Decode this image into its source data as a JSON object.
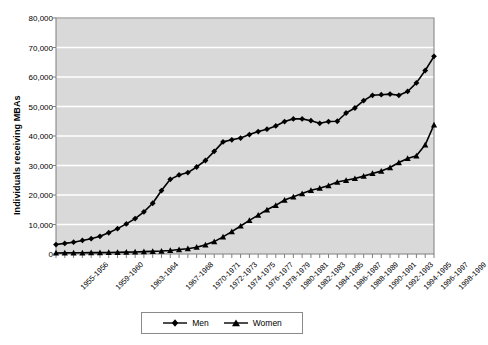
{
  "chart_data": {
    "type": "line",
    "title": "",
    "xlabel": "",
    "ylabel": "Individuals receiving MBAs",
    "ylim": [
      0,
      80000
    ],
    "ytick_labels": [
      "80,000",
      "70,000",
      "60,000",
      "50,000",
      "40,000",
      "30,000",
      "20,000",
      "10,000",
      "0"
    ],
    "ytick_values": [
      80000,
      70000,
      60000,
      50000,
      40000,
      30000,
      20000,
      10000,
      0
    ],
    "grid": true,
    "legend_position": "bottom",
    "categories": [
      "1955-1956",
      "1956-1957",
      "1957-1958",
      "1958-1959",
      "1959-1960",
      "1960-1961",
      "1961-1962",
      "1962-1963",
      "1963-1964",
      "1964-1965",
      "1965-1966",
      "1966-1967",
      "1967-1968",
      "1968-1969",
      "1969-1970",
      "1970-1971",
      "1971-1972",
      "1972-1973",
      "1973-1974",
      "1974-1975",
      "1975-1976",
      "1976-1977",
      "1977-1978",
      "1978-1979",
      "1979-1980",
      "1980-1981",
      "1981-1982",
      "1982-1983",
      "1983-1984",
      "1984-1985",
      "1985-1986",
      "1986-1987",
      "1987-1988",
      "1988-1989",
      "1989-1990",
      "1990-1991",
      "1991-1992",
      "1992-1993",
      "1993-1994",
      "1994-1995",
      "1995-1996",
      "1996-1997",
      "1997-1998",
      "1998-1999"
    ],
    "xtick_labels": [
      "1955-1956",
      "1959-1960",
      "1963-1964",
      "1967-1968",
      "1970-1971",
      "1972-1973",
      "1974-1975",
      "1976-1977",
      "1978-1979",
      "1980-1981",
      "1982-1983",
      "1984-1985",
      "1986-1987",
      "1988-1989",
      "1990-1991",
      "1992-1993",
      "1994-1995",
      "1996-1997",
      "1998-1999"
    ],
    "xtick_indices": [
      0,
      4,
      8,
      12,
      15,
      17,
      19,
      21,
      23,
      25,
      27,
      29,
      31,
      33,
      35,
      37,
      39,
      41,
      43
    ],
    "series": [
      {
        "name": "Men",
        "marker": "diamond",
        "color": "#000000",
        "values": [
          3200,
          3600,
          4000,
          4600,
          5200,
          6000,
          7200,
          8600,
          10200,
          12000,
          14300,
          17200,
          21500,
          25300,
          26800,
          27600,
          29500,
          31700,
          34800,
          38000,
          38700,
          39300,
          40500,
          41500,
          42300,
          43400,
          44900,
          45800,
          45800,
          45200,
          44300,
          44900,
          45000,
          47800,
          49500,
          52000,
          53800,
          54000,
          54200,
          53800,
          55100,
          58000,
          62200,
          67000
        ]
      },
      {
        "name": "Women",
        "marker": "triangle",
        "color": "#000000",
        "values": [
          350,
          380,
          400,
          420,
          450,
          480,
          520,
          560,
          620,
          700,
          800,
          900,
          1000,
          1200,
          1500,
          1800,
          2300,
          3100,
          4200,
          5800,
          7600,
          9500,
          11400,
          13200,
          15000,
          16500,
          18300,
          19400,
          20500,
          21600,
          22300,
          23200,
          24400,
          25000,
          25600,
          26400,
          27300,
          28100,
          29300,
          31000,
          32400,
          33300,
          37000,
          43800
        ]
      }
    ]
  },
  "legend": {
    "items": [
      {
        "label": "Men"
      },
      {
        "label": "Women"
      }
    ]
  },
  "colors": {
    "plot_background": "#d9d9d9",
    "gridline": "#ffffff",
    "axis": "#7f7f7f",
    "series": "#000000",
    "page_background": "#ffffff"
  }
}
